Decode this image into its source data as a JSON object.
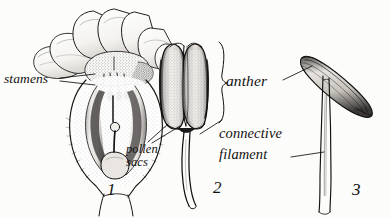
{
  "plate": {
    "title": "Stamen structure plate",
    "background_color": "#fcfcfa",
    "ink_color": "#131212",
    "figures": [
      {
        "number": "1",
        "name": "flower-longitudinal-section",
        "caption_number": "1"
      },
      {
        "number": "2",
        "name": "stamen-front-view",
        "caption_number": "2"
      },
      {
        "number": "3",
        "name": "versatile-stamen",
        "caption_number": "3"
      }
    ]
  },
  "labels": {
    "stamens": "stamens",
    "pollen_sacs_line1": "pollen",
    "pollen_sacs_line2": "sacs",
    "anther": "anther",
    "connective": "connective",
    "filament": "filament"
  },
  "figure_numbers": {
    "one": "1",
    "two": "2",
    "three": "3"
  }
}
